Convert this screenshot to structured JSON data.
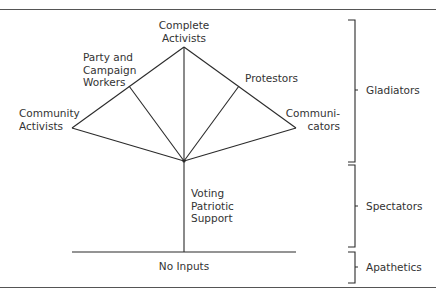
{
  "diagram": {
    "type": "hierarchy-fan",
    "nodes": {
      "complete_activists": {
        "line1": "Complete",
        "line2": "Activists"
      },
      "party_campaign": {
        "line1": "Party and",
        "line2": "Campaign",
        "line3": "Workers"
      },
      "protestors": {
        "line1": "Protestors"
      },
      "community_activists": {
        "line1": "Community",
        "line2": "Activists"
      },
      "communicators": {
        "line1": "Communi-",
        "line2": "cators"
      },
      "voting": {
        "line1": "Voting",
        "line2": "Patriotic",
        "line3": "Support"
      },
      "no_inputs": {
        "line1": "No Inputs"
      }
    },
    "groups": [
      {
        "label": "Gladiators"
      },
      {
        "label": "Spectators"
      },
      {
        "label": "Apathetics"
      }
    ],
    "colors": {
      "line": "#2a2a2a",
      "text": "#333333"
    }
  }
}
